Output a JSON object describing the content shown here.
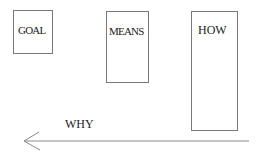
{
  "boxes": [
    {
      "id": "goal",
      "label": "GOAL"
    },
    {
      "id": "means",
      "label": "MEANS"
    },
    {
      "id": "how",
      "label": "HOW"
    }
  ],
  "arrow": {
    "label": "WHY",
    "direction": "left"
  }
}
